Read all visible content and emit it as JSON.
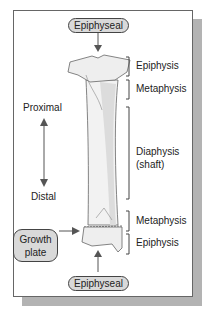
{
  "diagram": {
    "top_label": "Epiphyseal",
    "bottom_label": "Epiphyseal",
    "growth_plate": {
      "line1": "Growth",
      "line2": "plate"
    },
    "direction": {
      "top": "Proximal",
      "bottom": "Distal"
    },
    "regions": [
      {
        "name": "Epiphysis"
      },
      {
        "name": "Metaphysis"
      },
      {
        "name": "Diaphysis",
        "sub": "(shaft)"
      },
      {
        "name": "Metaphysis"
      },
      {
        "name": "Epiphysis"
      }
    ],
    "colors": {
      "pill_fill": "#d9d9d9",
      "bone_fill": "#f2f2f2",
      "bone_shade": "#dcdcdc",
      "shadow": "#b3b3b3"
    }
  }
}
